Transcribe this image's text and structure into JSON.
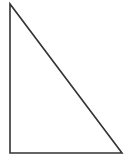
{
  "canvas": {
    "width": 130,
    "height": 159,
    "background_color": "#ffffff",
    "name": "right-triangle-figure"
  },
  "figure": {
    "type": "polygon",
    "shape_name": "right-triangle",
    "fill": "none",
    "fill_color": "none",
    "stroke_color": "#333333",
    "stroke_width": 1.6,
    "points": "10,4 10,153 122,153",
    "vertices": [
      {
        "label": "top-left-apex",
        "x": 10,
        "y": 4
      },
      {
        "label": "bottom-left-right-angle",
        "x": 10,
        "y": 153
      },
      {
        "label": "bottom-right",
        "x": 122,
        "y": 153
      }
    ],
    "edges": [
      {
        "name": "vertical-leg",
        "from": [
          10,
          4
        ],
        "to": [
          10,
          153
        ],
        "length_px": 149
      },
      {
        "name": "horizontal-leg",
        "from": [
          10,
          153
        ],
        "to": [
          122,
          153
        ],
        "length_px": 112
      },
      {
        "name": "hypotenuse",
        "from": [
          10,
          4
        ],
        "to": [
          122,
          153
        ],
        "length_px": 186
      }
    ]
  }
}
